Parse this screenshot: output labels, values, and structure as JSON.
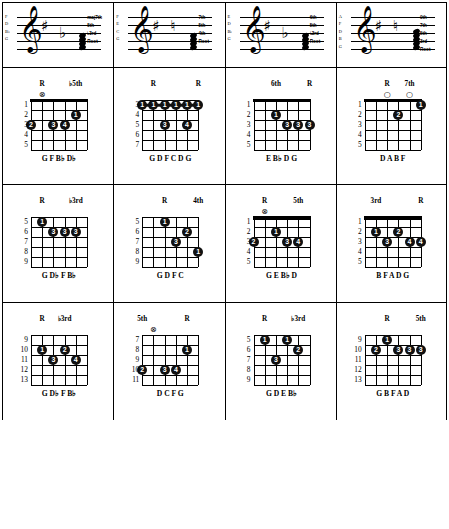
{
  "page": {
    "instrument": "guitar",
    "columns_count": 4,
    "rows_per_column": 3
  },
  "columns": [
    {
      "staff": {
        "clef": "treble-clef",
        "accidentals": [
          "sharp",
          "flat"
        ],
        "pitch_names": [
          "F",
          "D",
          "B♭",
          "G"
        ],
        "interval_labels": [
          "maj7th",
          "5th",
          "♭3rd",
          "Root"
        ]
      },
      "diagrams": [
        {
          "top_labels": [
            {
              "text": "R",
              "string": 5
            },
            {
              "text": "♭5th",
              "string": 2
            }
          ],
          "markers": [
            {
              "string": 5,
              "type": "circle-x"
            }
          ],
          "fret_numbers": [
            "1",
            "2",
            "3",
            "4",
            "5"
          ],
          "dots": [
            {
              "string": 6,
              "fret": 3,
              "finger": "2"
            },
            {
              "string": 4,
              "fret": 3,
              "finger": "3"
            },
            {
              "string": 3,
              "fret": 3,
              "finger": "4"
            },
            {
              "string": 2,
              "fret": 2,
              "finger": "1"
            }
          ],
          "barres": [],
          "note_names": "G     F B♭ D♭"
        },
        {
          "top_labels": [
            {
              "text": "R",
              "string": 5
            },
            {
              "text": "♭3rd",
              "string": 2
            }
          ],
          "markers": [],
          "fret_numbers": [
            "5",
            "6",
            "7",
            "8",
            "9"
          ],
          "dots": [
            {
              "string": 5,
              "fret": 5,
              "finger": "1"
            },
            {
              "string": 4,
              "fret": 6,
              "finger": "3"
            },
            {
              "string": 3,
              "fret": 6,
              "finger": "3"
            },
            {
              "string": 2,
              "fret": 6,
              "finger": "3"
            }
          ],
          "barres": [],
          "note_names": "G D♭ F B♭"
        },
        {
          "top_labels": [
            {
              "text": "R",
              "string": 5
            },
            {
              "text": "♭3rd",
              "string": 3
            }
          ],
          "markers": [],
          "fret_numbers": [
            "9",
            "10",
            "11",
            "12",
            "13"
          ],
          "dots": [
            {
              "string": 5,
              "fret": 10,
              "finger": "1"
            },
            {
              "string": 3,
              "fret": 10,
              "finger": "2"
            },
            {
              "string": 4,
              "fret": 11,
              "finger": "3"
            },
            {
              "string": 2,
              "fret": 11,
              "finger": "4"
            }
          ],
          "barres": [],
          "note_names": "G D♭ F B♭"
        }
      ]
    },
    {
      "staff": {
        "clef": "treble-clef",
        "accidentals": [
          "sharp",
          "natural"
        ],
        "pitch_names": [
          "F",
          "E",
          "C",
          "G"
        ],
        "interval_labels": [
          "7th",
          "5th",
          "4th",
          "Root"
        ]
      },
      "diagrams": [
        {
          "top_labels": [
            {
              "text": "R",
              "string": 5
            },
            {
              "text": "R",
              "string": 1
            }
          ],
          "markers": [],
          "fret_numbers": [
            "3",
            "4",
            "5",
            "6",
            "7"
          ],
          "dots": [
            {
              "string": 4,
              "fret": 5,
              "finger": "3"
            },
            {
              "string": 2,
              "fret": 5,
              "finger": "4"
            }
          ],
          "barres": [
            {
              "fret": 3,
              "from_string": 6,
              "to_string": 1,
              "finger": "1"
            }
          ],
          "note_names": "G D F C D G"
        },
        {
          "top_labels": [
            {
              "text": "R",
              "string": 4
            },
            {
              "text": "4th",
              "string": 1
            }
          ],
          "markers": [],
          "fret_numbers": [
            "5",
            "6",
            "7",
            "8",
            "9"
          ],
          "dots": [
            {
              "string": 4,
              "fret": 5,
              "finger": "1"
            },
            {
              "string": 2,
              "fret": 6,
              "finger": "2"
            },
            {
              "string": 3,
              "fret": 7,
              "finger": "3"
            },
            {
              "string": 1,
              "fret": 8,
              "finger": "1"
            }
          ],
          "barres": [],
          "note_names": "G D F C"
        },
        {
          "top_labels": [
            {
              "text": "5th",
              "string": 6
            },
            {
              "text": "R",
              "string": 2
            }
          ],
          "markers": [
            {
              "string": 5,
              "type": "circle-x"
            }
          ],
          "fret_numbers": [
            "7",
            "8",
            "9",
            "10",
            "11"
          ],
          "dots": [
            {
              "string": 2,
              "fret": 8,
              "finger": "1"
            },
            {
              "string": 6,
              "fret": 10,
              "finger": "2"
            },
            {
              "string": 4,
              "fret": 10,
              "finger": "3"
            },
            {
              "string": 3,
              "fret": 10,
              "finger": "4"
            }
          ],
          "barres": [],
          "note_names": "D     C F G"
        }
      ]
    },
    {
      "staff": {
        "clef": "treble-clef",
        "accidentals": [
          "sharp",
          "flat"
        ],
        "pitch_names": [
          "E",
          "D",
          "B♭",
          "G"
        ],
        "interval_labels": [
          "6th",
          "5th",
          "♭3rd",
          "Root"
        ]
      },
      "diagrams": [
        {
          "top_labels": [
            {
              "text": "6th",
              "string": 4
            },
            {
              "text": "R",
              "string": 1
            }
          ],
          "markers": [],
          "fret_numbers": [
            "1",
            "2",
            "3",
            "4",
            "5"
          ],
          "dots": [
            {
              "string": 4,
              "fret": 2,
              "finger": "1"
            },
            {
              "string": 3,
              "fret": 3,
              "finger": "3"
            },
            {
              "string": 2,
              "fret": 3,
              "finger": "3"
            },
            {
              "string": 1,
              "fret": 3,
              "finger": "3"
            }
          ],
          "barres": [],
          "note_names": "E B♭ D G"
        },
        {
          "top_labels": [
            {
              "text": "R",
              "string": 5
            },
            {
              "text": "5th",
              "string": 2
            }
          ],
          "markers": [
            {
              "string": 5,
              "type": "circle-x"
            }
          ],
          "fret_numbers": [
            "1",
            "2",
            "3",
            "4",
            "5"
          ],
          "dots": [
            {
              "string": 6,
              "fret": 3,
              "finger": "2"
            },
            {
              "string": 4,
              "fret": 2,
              "finger": "1"
            },
            {
              "string": 3,
              "fret": 3,
              "finger": "3"
            },
            {
              "string": 2,
              "fret": 3,
              "finger": "4"
            }
          ],
          "barres": [],
          "note_names": "G     E B♭ D"
        },
        {
          "top_labels": [
            {
              "text": "R",
              "string": 5
            },
            {
              "text": "♭3rd",
              "string": 2
            }
          ],
          "markers": [],
          "fret_numbers": [
            "5",
            "6",
            "7",
            "8",
            "9"
          ],
          "dots": [
            {
              "string": 5,
              "fret": 5,
              "finger": "1"
            },
            {
              "string": 3,
              "fret": 5,
              "finger": "1"
            },
            {
              "string": 2,
              "fret": 6,
              "finger": "2"
            },
            {
              "string": 4,
              "fret": 7,
              "finger": "3"
            }
          ],
          "barres": [],
          "note_names": "G D E B♭"
        }
      ]
    },
    {
      "staff": {
        "clef": "treble-clef",
        "accidentals": [
          "sharp",
          "natural"
        ],
        "pitch_names": [
          "A",
          "F",
          "D",
          "B",
          "G"
        ],
        "interval_labels": [
          "9th",
          "7th",
          "5th",
          "3rd",
          "Root"
        ]
      },
      "diagrams": [
        {
          "top_labels": [
            {
              "text": "R",
              "string": 4
            },
            {
              "text": "7th",
              "string": 2
            }
          ],
          "markers": [
            {
              "string": 4,
              "type": "open"
            },
            {
              "string": 2,
              "type": "open"
            }
          ],
          "fret_numbers": [
            "1",
            "2",
            "3",
            "4",
            "5"
          ],
          "dots": [
            {
              "string": 3,
              "fret": 2,
              "finger": "2"
            },
            {
              "string": 1,
              "fret": 1,
              "finger": "1"
            }
          ],
          "barres": [],
          "note_names": "D A B F"
        },
        {
          "top_labels": [
            {
              "text": "3rd",
              "string": 5
            },
            {
              "text": "R",
              "string": 1
            }
          ],
          "markers": [],
          "fret_numbers": [
            "1",
            "2",
            "3",
            "4",
            "5"
          ],
          "dots": [
            {
              "string": 5,
              "fret": 2,
              "finger": "1"
            },
            {
              "string": 3,
              "fret": 2,
              "finger": "2"
            },
            {
              "string": 4,
              "fret": 3,
              "finger": "3"
            },
            {
              "string": 2,
              "fret": 3,
              "finger": "4"
            },
            {
              "string": 1,
              "fret": 3,
              "finger": "4"
            }
          ],
          "barres": [],
          "note_names": "B F A D G"
        },
        {
          "top_labels": [
            {
              "text": "R",
              "string": 4
            },
            {
              "text": "5th",
              "string": 1
            }
          ],
          "markers": [],
          "fret_numbers": [
            "9",
            "10",
            "11",
            "12",
            "13"
          ],
          "dots": [
            {
              "string": 4,
              "fret": 9,
              "finger": "1"
            },
            {
              "string": 5,
              "fret": 10,
              "finger": "2"
            },
            {
              "string": 3,
              "fret": 10,
              "finger": "3"
            },
            {
              "string": 2,
              "fret": 10,
              "finger": "3"
            },
            {
              "string": 1,
              "fret": 10,
              "finger": "3"
            }
          ],
          "barres": [],
          "note_names": "G B F A D"
        }
      ]
    }
  ]
}
